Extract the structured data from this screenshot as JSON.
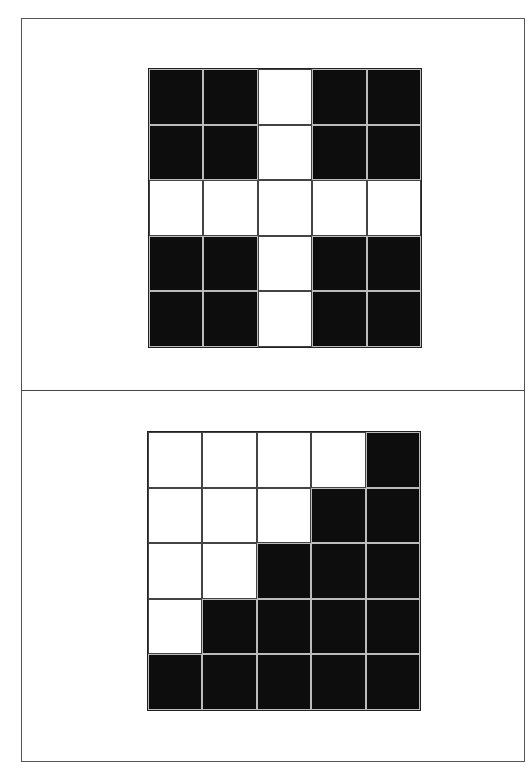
{
  "colors": {
    "filled": "#0d0d0d",
    "empty": "#ffffff",
    "frame": "#555555"
  },
  "panels": [
    {
      "name": "top-pattern",
      "rows": 5,
      "cols": 5,
      "cells": [
        [
          1,
          1,
          0,
          1,
          1
        ],
        [
          1,
          1,
          0,
          1,
          1
        ],
        [
          0,
          0,
          0,
          0,
          0
        ],
        [
          1,
          1,
          0,
          1,
          1
        ],
        [
          1,
          1,
          0,
          1,
          1
        ]
      ]
    },
    {
      "name": "bottom-pattern",
      "rows": 5,
      "cols": 5,
      "cells": [
        [
          0,
          0,
          0,
          0,
          1
        ],
        [
          0,
          0,
          0,
          1,
          1
        ],
        [
          0,
          0,
          1,
          1,
          1
        ],
        [
          0,
          1,
          1,
          1,
          1
        ],
        [
          1,
          1,
          1,
          1,
          1
        ]
      ]
    }
  ]
}
